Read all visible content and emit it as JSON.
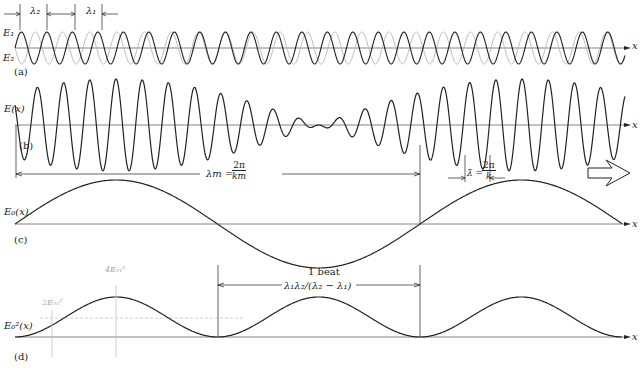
{
  "labels": {
    "lambda2": "λ₂",
    "lambda1": "λ₁",
    "E1": "E₁",
    "E2": "E₂",
    "panel_a": "(a)",
    "panel_b": "(b)",
    "panel_c": "(c)",
    "panel_d": "(d)",
    "Ex": "E(x)",
    "E0x": "E₀(x)",
    "E0sq": "E₀²(x)",
    "x": "x",
    "lambda_m": "λm =",
    "lambda_m_num": "2π",
    "lambda_m_den": "km",
    "lambda_bar": "λ̄ =",
    "lambda_bar_num": "2π",
    "lambda_bar_den": "k̄",
    "beat_label": "1 beat",
    "beat_formula": "λ₁λ₂/(λ₂ − λ₁)",
    "peak_label": "4E₀₁²",
    "mean_label": "2E₀₁²"
  },
  "colors": {
    "ink": "#222222",
    "faded": "#bbbbbb",
    "axis": "#666666"
  },
  "chart_data": {
    "type": "line",
    "panels": [
      {
        "id": "a",
        "series": [
          {
            "name": "E1",
            "wavelength_px": 25.5
          },
          {
            "name": "E2",
            "wavelength_px": 27.2
          }
        ]
      },
      {
        "id": "b",
        "series": [
          {
            "name": "E(x)",
            "description": "E1+E2, carrier modulated by envelope"
          }
        ]
      },
      {
        "id": "c",
        "series": [
          {
            "name": "E0(x)",
            "description": "envelope cos(km x/2), period λm"
          }
        ]
      },
      {
        "id": "d",
        "series": [
          {
            "name": "E0^2(x)",
            "description": "intensity envelope, max 4E01^2, mean 2E01^2"
          }
        ]
      }
    ],
    "xlabel": "x"
  }
}
